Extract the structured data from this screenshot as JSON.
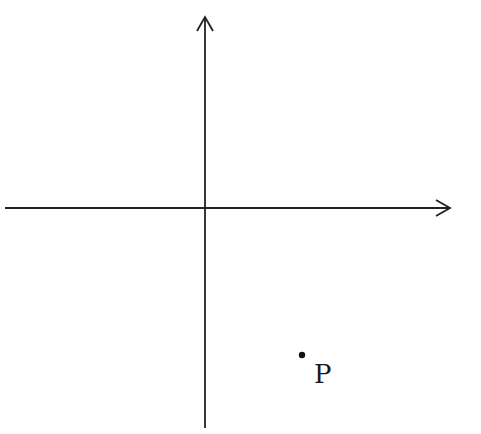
{
  "diagram": {
    "type": "coordinate-plane",
    "origin": {
      "x": 205,
      "y": 208
    },
    "axes": {
      "x_axis": {
        "from": [
          5,
          208
        ],
        "to": [
          450,
          208
        ],
        "arrow": "right"
      },
      "y_axis": {
        "from": [
          205,
          428
        ],
        "to": [
          205,
          16
        ],
        "arrow": "up"
      }
    },
    "points": [
      {
        "name": "P",
        "x": 302,
        "y": 355,
        "label": "P",
        "quadrant": "IV"
      }
    ],
    "colors": {
      "line": "#222222",
      "background": "#ffffff"
    }
  }
}
